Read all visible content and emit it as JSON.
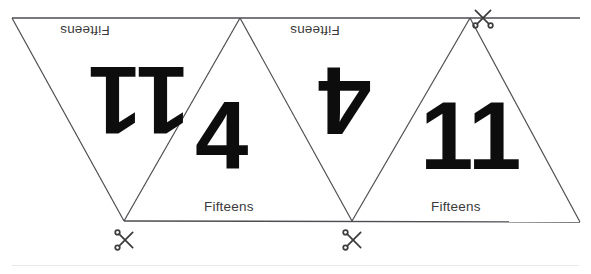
{
  "page": {
    "background_color": "#ffffff",
    "line_color": "#4d4d52",
    "text_color": "#3a3a3a",
    "number_color": "#0d0d0d"
  },
  "strip": {
    "name": "triangle-flashcard-strip",
    "triangle_count": 4,
    "row_top_y": 18,
    "row_bottom_y": 221,
    "left_x": 12,
    "right_x": 580
  },
  "triangles": [
    {
      "id": "triangle-1",
      "orientation": "pointing-down",
      "number": "11",
      "number_rotated": true,
      "label": "Fifteens",
      "label_rotated": true,
      "number_font_size": 96,
      "number_x": 88,
      "number_y": 52,
      "label_x": 60,
      "label_y": 23
    },
    {
      "id": "triangle-2",
      "orientation": "pointing-up",
      "number": "4",
      "number_rotated": false,
      "label": "Fifteens",
      "label_rotated": false,
      "number_font_size": 96,
      "number_x": 195,
      "number_y": 88,
      "label_x": 204,
      "label_y": 199
    },
    {
      "id": "triangle-3",
      "orientation": "pointing-down",
      "number": "4",
      "number_rotated": true,
      "label": "Fifteens",
      "label_rotated": true,
      "number_font_size": 96,
      "number_x": 318,
      "number_y": 52,
      "label_x": 290,
      "label_y": 23
    },
    {
      "id": "triangle-4",
      "orientation": "pointing-up",
      "number": "11",
      "number_rotated": false,
      "label": "Fifteens",
      "label_rotated": false,
      "number_font_size": 96,
      "number_x": 420,
      "number_y": 88,
      "label_x": 431,
      "label_y": 199
    }
  ],
  "cut_marks": [
    {
      "id": "cut-mark-top-right",
      "x": 470,
      "y": 6,
      "rotation": -90,
      "size": 26
    },
    {
      "id": "cut-mark-bottom-left",
      "x": 111,
      "y": 227,
      "rotation": 0,
      "size": 26
    },
    {
      "id": "cut-mark-bottom-middle",
      "x": 339,
      "y": 227,
      "rotation": 0,
      "size": 26
    }
  ],
  "icons": {
    "scissors": "scissors-icon"
  },
  "geometry": {
    "polylines": [
      "12,18 580,18",
      "12,18 124,221",
      "124,221 240,18",
      "240,18 352,221",
      "352,221 470,18",
      "470,18 580,222",
      "124,221 580,222"
    ]
  }
}
